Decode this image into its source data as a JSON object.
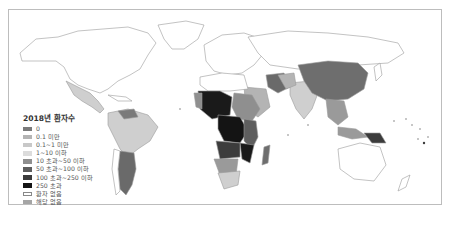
{
  "legend": {
    "title": "2018년 환자수",
    "items": [
      {
        "label": "0",
        "color": "#7a7a7a",
        "border": "none"
      },
      {
        "label": "0.1 미만",
        "color": "#b4b4b4",
        "border": "none"
      },
      {
        "label": "0.1~1 미만",
        "color": "#c8c8c8",
        "border": "none"
      },
      {
        "label": "1~10 이하",
        "color": "#dcdcdc",
        "border": "none"
      },
      {
        "label": "10 초과~50 이하",
        "color": "#8f8f8f",
        "border": "none"
      },
      {
        "label": "50 초과~100 이하",
        "color": "#5e5e5e",
        "border": "none"
      },
      {
        "label": "100 초과~250 이하",
        "color": "#3c3c3c",
        "border": "none"
      },
      {
        "label": "250 초과",
        "color": "#141414",
        "border": "none"
      },
      {
        "label": "환자 없음",
        "color": "#ffffff",
        "border": "1px solid #888"
      },
      {
        "label": "해당 없음",
        "color": "#a5a5a5",
        "border": "none"
      }
    ]
  },
  "colors": {
    "frame_border": "#bdbdbd",
    "country_outline": "#9a9a9a",
    "no_cases_fill": "#ffffff"
  }
}
